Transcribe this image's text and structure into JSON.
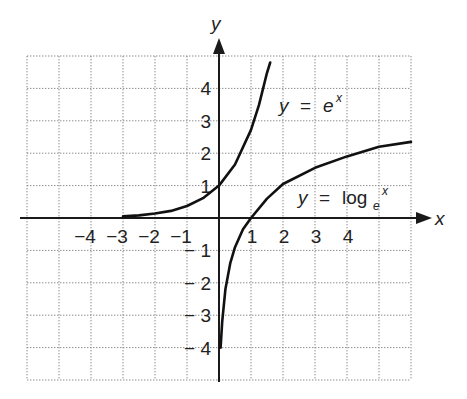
{
  "chart_data": {
    "type": "line",
    "title": "",
    "xlabel": "x",
    "ylabel": "y",
    "xlim": [
      -6,
      6
    ],
    "ylim": [
      -5,
      5
    ],
    "grid": true,
    "grid_style": "dotted",
    "x_tick_labels": [
      "-4",
      "-3",
      "-2",
      "-1",
      "1",
      "2",
      "3",
      "4"
    ],
    "x_ticks": [
      -4,
      -3,
      -2,
      -1,
      1,
      2,
      3,
      4
    ],
    "y_tick_labels": [
      "4",
      "3",
      "2",
      "1",
      "-1",
      "-2",
      "-3",
      "-4"
    ],
    "y_ticks": [
      4,
      3,
      2,
      1,
      -1,
      -2,
      -3,
      -4
    ],
    "series": [
      {
        "name": "y = e^x",
        "label_text": {
          "lhs": "y",
          "eq": "=",
          "base": "e",
          "exp": "x"
        },
        "x": [
          -3,
          -2.5,
          -2,
          -1.5,
          -1,
          -0.5,
          0,
          0.5,
          1,
          1.25,
          1.5,
          1.6
        ],
        "y": [
          0.05,
          0.08,
          0.14,
          0.22,
          0.37,
          0.61,
          1.0,
          1.65,
          2.72,
          3.49,
          4.48,
          4.8
        ]
      },
      {
        "name": "y = log_e x",
        "label_text": {
          "lhs": "y",
          "eq": "=",
          "fn": "log",
          "sub": "e",
          "arg": "x"
        },
        "x": [
          0.05,
          0.1,
          0.2,
          0.35,
          0.5,
          0.75,
          1,
          1.5,
          2,
          3,
          4,
          5,
          6
        ],
        "y": [
          -4.0,
          -3.2,
          -2.2,
          -1.4,
          -0.9,
          -0.35,
          0,
          0.6,
          1.05,
          1.55,
          1.9,
          2.2,
          2.35
        ]
      }
    ]
  },
  "axes": {
    "x_label": "x",
    "y_label": "y"
  }
}
